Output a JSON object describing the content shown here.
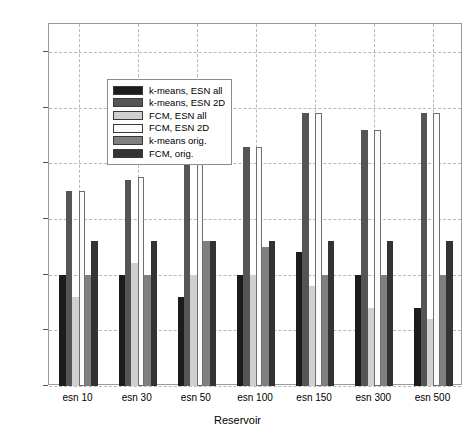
{
  "chart_data": {
    "type": "bar",
    "title": "",
    "xlabel": "Reservoir",
    "ylabel": "Accuracy",
    "categories": [
      "esn 10",
      "esn 30",
      "esn 50",
      "esn 100",
      "esn 150",
      "esn 300",
      "esn 500"
    ],
    "ylim": [
      30,
      95
    ],
    "yticks": [
      30,
      40,
      50,
      60,
      70,
      80,
      90
    ],
    "grid": true,
    "legend_position": "upper-left-inside",
    "series": [
      {
        "name": "k-means, ESN all",
        "color": "#1c1c1c",
        "values": [
          50,
          50,
          46,
          50,
          54,
          50,
          44
        ]
      },
      {
        "name": "k-means, ESN 2D",
        "color": "#555555",
        "values": [
          65,
          67,
          75,
          73,
          79,
          76,
          79
        ]
      },
      {
        "name": "FCM, ESN all",
        "color": "#d0d0d0",
        "values": [
          46,
          52,
          50,
          50,
          48,
          44,
          42
        ]
      },
      {
        "name": "FCM, ESN 2D",
        "color": "#fbfbfb",
        "values": [
          65,
          67.5,
          73,
          73,
          79,
          76,
          79
        ]
      },
      {
        "name": "k-means orig.",
        "color": "#808080",
        "values": [
          50,
          50,
          56,
          55,
          50,
          50,
          50
        ]
      },
      {
        "name": "FCM, orig.",
        "color": "#333333",
        "values": [
          56,
          56,
          56,
          56,
          56,
          56,
          56
        ]
      }
    ]
  },
  "axis": {
    "ylabel": "Accuracy",
    "xlabel": "Reservoir",
    "ytick_labels": [
      "90",
      "80",
      "70",
      "60",
      "50",
      "40",
      "30"
    ],
    "xtick_labels": [
      "esn 10",
      "esn 30",
      "esn 50",
      "esn 100",
      "esn 150",
      "esn 300",
      "esn 500"
    ]
  },
  "legend": {
    "items": [
      {
        "label": "k-means, ESN all",
        "color": "#1c1c1c"
      },
      {
        "label": "k-means, ESN 2D",
        "color": "#555555"
      },
      {
        "label": "FCM, ESN all",
        "color": "#d0d0d0"
      },
      {
        "label": "FCM, ESN 2D",
        "color": "#fbfbfb"
      },
      {
        "label": "k-means orig.",
        "color": "#808080"
      },
      {
        "label": "FCM, orig.",
        "color": "#333333"
      }
    ]
  }
}
